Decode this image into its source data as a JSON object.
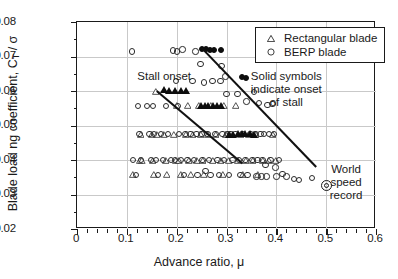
{
  "chart_data": {
    "type": "scatter",
    "title": "",
    "xlabel": "Advance ratio, μ",
    "ylabel_parts": {
      "pre": "Blade load ng coefficient, C",
      "sub": "T",
      "post": " / σ"
    },
    "ylabel": "Blade load ng coefficient, C_T / σ",
    "xlim": [
      0,
      0.6
    ],
    "ylim": [
      0.02,
      0.08
    ],
    "xticks": [
      0,
      0.1,
      0.2,
      0.3,
      0.4,
      0.5,
      0.6
    ],
    "xticklabels": [
      "0",
      "0.1",
      "0.2",
      "0.3",
      "0.4",
      "0.5",
      "0.6"
    ],
    "yticks": [
      0.02,
      0.03,
      0.04,
      0.05,
      0.06,
      0.07,
      0.08
    ],
    "yticklabels": [
      "0.02",
      "0.03",
      "0.04",
      "0.05",
      "0.06",
      "0.07",
      "0.08"
    ],
    "x_minor_per_major": 5,
    "y_minor_per_major": 2,
    "grid": true,
    "legend_position": "top-right",
    "series": [
      {
        "name": "Rectangular blade",
        "marker": "triangle-open",
        "points": [
          [
            0.112,
            0.0357
          ],
          [
            0.125,
            0.04
          ],
          [
            0.127,
            0.0475
          ],
          [
            0.13,
            0.04
          ],
          [
            0.15,
            0.0475
          ],
          [
            0.152,
            0.04
          ],
          [
            0.155,
            0.0357
          ],
          [
            0.158,
            0.06
          ],
          [
            0.16,
            0.0475
          ],
          [
            0.175,
            0.0475
          ],
          [
            0.178,
            0.04
          ],
          [
            0.18,
            0.0357
          ],
          [
            0.195,
            0.0475
          ],
          [
            0.198,
            0.04
          ],
          [
            0.2,
            0.0557
          ],
          [
            0.205,
            0.04
          ],
          [
            0.208,
            0.0357
          ],
          [
            0.218,
            0.0475
          ],
          [
            0.222,
            0.0557
          ],
          [
            0.225,
            0.04
          ],
          [
            0.228,
            0.0357
          ],
          [
            0.232,
            0.0475
          ],
          [
            0.24,
            0.04
          ],
          [
            0.245,
            0.0557
          ],
          [
            0.248,
            0.0475
          ],
          [
            0.252,
            0.04
          ],
          [
            0.255,
            0.0357
          ],
          [
            0.262,
            0.0475
          ],
          [
            0.268,
            0.0557
          ],
          [
            0.272,
            0.04
          ],
          [
            0.278,
            0.0475
          ],
          [
            0.288,
            0.04
          ],
          [
            0.292,
            0.0357
          ],
          [
            0.295,
            0.0557
          ],
          [
            0.298,
            0.0475
          ],
          [
            0.305,
            0.04
          ],
          [
            0.312,
            0.0475
          ],
          [
            0.318,
            0.0557
          ],
          [
            0.322,
            0.04
          ],
          [
            0.328,
            0.0475
          ],
          [
            0.332,
            0.0357
          ],
          [
            0.338,
            0.04
          ],
          [
            0.345,
            0.0475
          ],
          [
            0.352,
            0.04
          ],
          [
            0.358,
            0.0475
          ],
          [
            0.362,
            0.0357
          ],
          [
            0.372,
            0.04
          ],
          [
            0.385,
            0.04
          ],
          [
            0.392,
            0.0475
          ],
          [
            0.398,
            0.04
          ]
        ]
      },
      {
        "name": "BERP blade",
        "marker": "circle-open",
        "points": [
          [
            0.11,
            0.0715
          ],
          [
            0.112,
            0.04
          ],
          [
            0.118,
            0.0357
          ],
          [
            0.122,
            0.0557
          ],
          [
            0.125,
            0.0475
          ],
          [
            0.128,
            0.04
          ],
          [
            0.14,
            0.0557
          ],
          [
            0.145,
            0.0475
          ],
          [
            0.148,
            0.04
          ],
          [
            0.152,
            0.0557
          ],
          [
            0.155,
            0.0475
          ],
          [
            0.158,
            0.04
          ],
          [
            0.162,
            0.0357
          ],
          [
            0.168,
            0.0475
          ],
          [
            0.172,
            0.04
          ],
          [
            0.178,
            0.0557
          ],
          [
            0.182,
            0.0475
          ],
          [
            0.188,
            0.04
          ],
          [
            0.192,
            0.0718
          ],
          [
            0.196,
            0.04
          ],
          [
            0.198,
            0.063
          ],
          [
            0.2,
            0.0715
          ],
          [
            0.203,
            0.0557
          ],
          [
            0.205,
            0.0475
          ],
          [
            0.208,
            0.04
          ],
          [
            0.212,
            0.0721
          ],
          [
            0.215,
            0.0357
          ],
          [
            0.218,
            0.0475
          ],
          [
            0.222,
            0.04
          ],
          [
            0.228,
            0.0475
          ],
          [
            0.232,
            0.063
          ],
          [
            0.235,
            0.04
          ],
          [
            0.238,
            0.0715
          ],
          [
            0.24,
            0.0475
          ],
          [
            0.242,
            0.0357
          ],
          [
            0.248,
            0.0678
          ],
          [
            0.25,
            0.0475
          ],
          [
            0.252,
            0.04
          ],
          [
            0.255,
            0.0625
          ],
          [
            0.258,
            0.0368
          ],
          [
            0.262,
            0.0475
          ],
          [
            0.265,
            0.04
          ],
          [
            0.268,
            0.0357
          ],
          [
            0.272,
            0.063
          ],
          [
            0.278,
            0.0475
          ],
          [
            0.282,
            0.04
          ],
          [
            0.285,
            0.0357
          ],
          [
            0.288,
            0.063
          ],
          [
            0.29,
            0.0672
          ],
          [
            0.292,
            0.0475
          ],
          [
            0.295,
            0.04
          ],
          [
            0.298,
            0.0642
          ],
          [
            0.3,
            0.0592
          ],
          [
            0.302,
            0.0475
          ],
          [
            0.305,
            0.0357
          ],
          [
            0.308,
            0.0475
          ],
          [
            0.312,
            0.04
          ],
          [
            0.318,
            0.0475
          ],
          [
            0.322,
            0.0592
          ],
          [
            0.325,
            0.04
          ],
          [
            0.328,
            0.0357
          ],
          [
            0.332,
            0.0475
          ],
          [
            0.338,
            0.04
          ],
          [
            0.34,
            0.057
          ],
          [
            0.342,
            0.0357
          ],
          [
            0.348,
            0.0475
          ],
          [
            0.352,
            0.04
          ],
          [
            0.355,
            0.0598
          ],
          [
            0.358,
            0.0475
          ],
          [
            0.36,
            0.0352
          ],
          [
            0.362,
            0.04
          ],
          [
            0.365,
            0.0565
          ],
          [
            0.368,
            0.0475
          ],
          [
            0.37,
            0.0352
          ],
          [
            0.372,
            0.04
          ],
          [
            0.375,
            0.0475
          ],
          [
            0.378,
            0.0385
          ],
          [
            0.38,
            0.0352
          ],
          [
            0.382,
            0.056
          ],
          [
            0.385,
            0.0475
          ],
          [
            0.388,
            0.04
          ],
          [
            0.392,
            0.0562
          ],
          [
            0.395,
            0.0475
          ],
          [
            0.398,
            0.0378
          ],
          [
            0.4,
            0.0352
          ],
          [
            0.405,
            0.04
          ],
          [
            0.412,
            0.036
          ],
          [
            0.42,
            0.0352
          ],
          [
            0.435,
            0.0345
          ],
          [
            0.445,
            0.0343
          ],
          [
            0.472,
            0.0348
          ]
        ]
      },
      {
        "name": "Rectangular blade - stall onset (solid)",
        "marker": "triangle-solid",
        "points": [
          [
            0.175,
            0.0605
          ],
          [
            0.185,
            0.06
          ],
          [
            0.196,
            0.06
          ],
          [
            0.208,
            0.06
          ],
          [
            0.218,
            0.06
          ],
          [
            0.248,
            0.0557
          ],
          [
            0.256,
            0.0557
          ],
          [
            0.262,
            0.0557
          ],
          [
            0.272,
            0.0557
          ],
          [
            0.28,
            0.0557
          ],
          [
            0.288,
            0.0557
          ],
          [
            0.305,
            0.0475
          ],
          [
            0.312,
            0.0475
          ],
          [
            0.322,
            0.0478
          ],
          [
            0.33,
            0.0478
          ],
          [
            0.338,
            0.0478
          ],
          [
            0.348,
            0.0478
          ],
          [
            0.356,
            0.0475
          ]
        ]
      },
      {
        "name": "BERP blade - stall onset (solid)",
        "marker": "circle-solid",
        "points": [
          [
            0.25,
            0.0722
          ],
          [
            0.258,
            0.0722
          ],
          [
            0.266,
            0.0718
          ],
          [
            0.274,
            0.0718
          ],
          [
            0.288,
            0.072
          ],
          [
            0.33,
            0.064
          ],
          [
            0.34,
            0.0638
          ]
        ]
      }
    ],
    "trend_lines": [
      {
        "name": "stall-onset-rectangular",
        "from": [
          0.16,
          0.06
        ],
        "to": [
          0.332,
          0.039
        ]
      },
      {
        "name": "stall-onset-berp",
        "from": [
          0.25,
          0.0725
        ],
        "to": [
          0.48,
          0.038
        ]
      }
    ],
    "special_points": [
      {
        "name": "world-speed-record",
        "marker": "double-circle",
        "x": 0.5,
        "y": 0.0325
      }
    ],
    "annotations": [
      {
        "name": "stall-onset-label",
        "text": "Stall onset",
        "x": 0.175,
        "y": 0.0645
      },
      {
        "name": "solid-symbols-note",
        "text": "Solid symbols\nindicate onset\nof stall",
        "x": 0.42,
        "y": 0.0605
      },
      {
        "name": "world-speed-record-label",
        "text": "World\nspeed\nrecord",
        "x": 0.54,
        "y": 0.0335
      }
    ],
    "legend_entries": [
      {
        "label": "Rectangular blade",
        "marker": "triangle-open"
      },
      {
        "label": "BERP blade",
        "marker": "circle-open"
      }
    ]
  }
}
